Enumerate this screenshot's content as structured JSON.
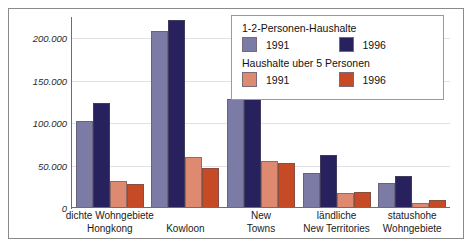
{
  "chart_data": {
    "type": "bar",
    "title": "",
    "xlabel": "",
    "ylabel": "",
    "ylim": [
      0,
      225000
    ],
    "grid": true,
    "legend_position": "top-right",
    "categories": [
      {
        "line1": "dichte Wohngebiete",
        "line2": "Hongkong"
      },
      {
        "line1": "",
        "line2": "Kowloon"
      },
      {
        "line1": "New",
        "line2": "Towns"
      },
      {
        "line1": "ländliche",
        "line2": "New Territories"
      },
      {
        "line1": "statushohe",
        "line2": "Wohngebiete"
      }
    ],
    "yticks": [
      "0",
      "50.000",
      "100.000",
      "150.000",
      "200.000"
    ],
    "ytick_values": [
      0,
      50000,
      100000,
      150000,
      200000
    ],
    "series": [
      {
        "name": "1-2-Personen-Haushalte 1991",
        "color": "#7b7ba6",
        "values": [
          103000,
          208000,
          128000,
          41000,
          30000
        ]
      },
      {
        "name": "1-2-Personen-Haushalte 1996",
        "color": "#27215e",
        "values": [
          124000,
          222000,
          184000,
          62000,
          38000
        ]
      },
      {
        "name": "Haushalte uber 5 Personen 1991",
        "color": "#dd8a71",
        "values": [
          32000,
          60000,
          55000,
          18000,
          6000
        ]
      },
      {
        "name": "Haushalte uber 5 Personen 1996",
        "color": "#c64a26",
        "values": [
          28000,
          47000,
          53000,
          19000,
          10000
        ]
      }
    ]
  },
  "legend": {
    "group1_title": "1-2-Personen-Haushalte",
    "group1_items": [
      {
        "label": "1991",
        "color": "#7b7ba6",
        "swatch": "light-purple"
      },
      {
        "label": "1996",
        "color": "#27215e",
        "swatch": "dark-navy"
      }
    ],
    "group2_title": "Haushalte uber 5 Personen",
    "group2_items": [
      {
        "label": "1991",
        "color": "#dd8a71",
        "swatch": "salmon"
      },
      {
        "label": "1996",
        "color": "#c64a26",
        "swatch": "orange"
      }
    ]
  }
}
